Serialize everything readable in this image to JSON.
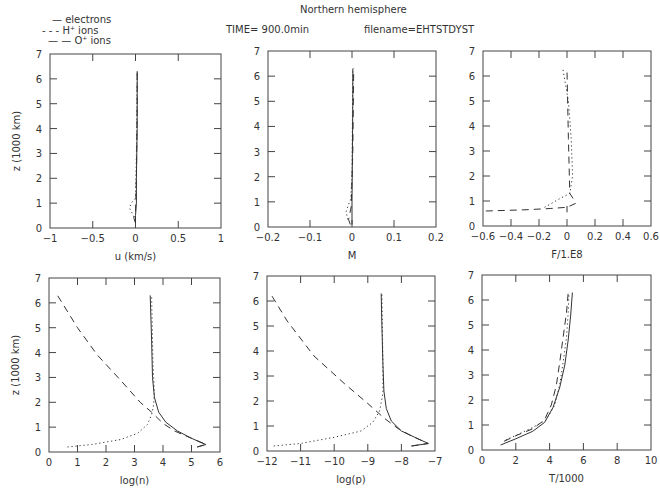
{
  "header": {
    "title": "Northern hemisphere",
    "time_label": "TIME= 900.0min",
    "filename_label": "filename=EHTSTDYST"
  },
  "legend": {
    "items": [
      {
        "style": "solid",
        "marker": "—",
        "label": "electrons"
      },
      {
        "style": "dotted",
        "marker": "- - -",
        "label": "H",
        "sup": "+",
        "suffix": " ions"
      },
      {
        "style": "dashed",
        "marker": "— —",
        "label": "O",
        "sup": "+",
        "suffix": " ions"
      }
    ]
  },
  "colors": {
    "line": "#333333",
    "axes": "#444444",
    "background": "#ffffff"
  },
  "chart_data": [
    {
      "type": "line",
      "id": "velocity",
      "box": [
        50,
        54,
        221,
        228
      ],
      "xlabel": "u (km/s)",
      "ylabel": "z (1000 km)",
      "xlim": [
        -1,
        1
      ],
      "ylim": [
        0,
        7
      ],
      "xticks": [
        -1,
        -0.5,
        0,
        0.5,
        1
      ],
      "xticklabels": [
        "−1",
        "−0.5",
        "0",
        "0.5",
        "1"
      ],
      "yticks": [
        0,
        1,
        2,
        3,
        4,
        5,
        6,
        7
      ],
      "series": [
        {
          "name": "electrons",
          "style": "solid",
          "x": [
            0.0,
            0.0,
            0.01,
            0.01,
            0.02,
            0.02,
            0.02
          ],
          "y": [
            0.2,
            0.5,
            1.0,
            2.0,
            4.0,
            5.5,
            6.3
          ]
        },
        {
          "name": "H+ ions",
          "style": "dotted",
          "x": [
            0.0,
            -0.04,
            -0.07,
            -0.05,
            0.0,
            0.01,
            0.02
          ],
          "y": [
            0.3,
            0.6,
            0.8,
            1.0,
            1.2,
            3.0,
            6.3
          ]
        },
        {
          "name": "O+ ions",
          "style": "dashed",
          "x": [
            0.0,
            -0.02,
            0.0,
            0.01,
            0.02,
            0.02
          ],
          "y": [
            0.2,
            0.4,
            0.6,
            2.0,
            5.0,
            6.3
          ]
        }
      ]
    },
    {
      "type": "line",
      "id": "mach",
      "box": [
        268,
        51,
        436,
        227
      ],
      "xlabel": "M",
      "ylabel": "",
      "xlim": [
        -0.2,
        0.2
      ],
      "ylim": [
        0,
        7
      ],
      "xticks": [
        -0.2,
        -0.1,
        0,
        0.1,
        0.2
      ],
      "xticklabels": [
        "−0.2",
        "−0.1",
        "0",
        "0.1",
        "0.2"
      ],
      "yticks": [
        0,
        1,
        2,
        3,
        4,
        5,
        6,
        7
      ],
      "series": [
        {
          "name": "electrons",
          "style": "solid",
          "x": [
            0.0,
            0.0,
            0.001,
            0.002,
            0.002
          ],
          "y": [
            0.1,
            1.0,
            3.0,
            5.0,
            6.3
          ]
        },
        {
          "name": "H+ ions",
          "style": "dotted",
          "x": [
            -0.01,
            -0.014,
            -0.008,
            -0.003,
            0.0,
            0.002
          ],
          "y": [
            0.3,
            0.6,
            0.9,
            1.1,
            2.0,
            6.3
          ]
        },
        {
          "name": "O+ ions",
          "style": "dashed",
          "x": [
            -0.004,
            -0.008,
            -0.002,
            0.002,
            0.004
          ],
          "y": [
            0.1,
            0.3,
            0.8,
            3.0,
            6.3
          ]
        }
      ]
    },
    {
      "type": "line",
      "id": "flux",
      "box": [
        483,
        51,
        651,
        226
      ],
      "xlabel": "F/1.E8",
      "ylabel": "",
      "xlim": [
        -0.6,
        0.6
      ],
      "ylim": [
        0,
        7
      ],
      "xticks": [
        -0.6,
        -0.4,
        -0.2,
        0,
        0.2,
        0.4,
        0.6
      ],
      "xticklabels": [
        "−0.6",
        "−0.4",
        "−0.2",
        "0",
        "0.2",
        "0.4",
        "0.6"
      ],
      "yticks": [
        0,
        1,
        2,
        3,
        4,
        5,
        6,
        7
      ],
      "series": [
        {
          "name": "electrons",
          "style": "solid",
          "x": [
            0.0,
            0.0
          ],
          "y": [
            0.55,
            0.8
          ]
        },
        {
          "name": "H+ ions",
          "style": "dotted",
          "x": [
            -0.16,
            -0.05,
            0.02,
            0.04,
            0.03,
            0.01,
            -0.03
          ],
          "y": [
            0.75,
            1.1,
            1.3,
            2.0,
            3.5,
            5.0,
            6.3
          ]
        },
        {
          "name": "O+ ions",
          "style": "dashed",
          "x": [
            -0.58,
            -0.3,
            -0.12,
            0.0,
            0.06,
            0.05,
            0.02,
            0.01,
            0.0
          ],
          "y": [
            0.6,
            0.65,
            0.7,
            0.75,
            0.9,
            1.05,
            1.3,
            3.5,
            6.2
          ]
        }
      ]
    },
    {
      "type": "line",
      "id": "density",
      "box": [
        49,
        278,
        220,
        452
      ],
      "xlabel": "log(n)",
      "ylabel": "z (1000 km)",
      "xlim": [
        0,
        6
      ],
      "ylim": [
        0,
        7
      ],
      "xticks": [
        0,
        1,
        2,
        3,
        4,
        5,
        6
      ],
      "xticklabels": [
        "0",
        "1",
        "2",
        "3",
        "4",
        "5",
        "6"
      ],
      "yticks": [
        0,
        1,
        2,
        3,
        4,
        5,
        6,
        7
      ],
      "series": [
        {
          "name": "electrons",
          "style": "solid",
          "x": [
            5.2,
            5.5,
            5.0,
            4.5,
            4.1,
            3.85,
            3.7,
            3.63,
            3.6,
            3.55
          ],
          "y": [
            0.2,
            0.3,
            0.55,
            0.85,
            1.2,
            1.6,
            2.2,
            3.0,
            4.5,
            6.3
          ]
        },
        {
          "name": "H+ ions",
          "style": "dotted",
          "x": [
            0.65,
            1.5,
            2.5,
            3.1,
            3.45,
            3.6,
            3.67,
            3.7,
            3.65,
            3.6
          ],
          "y": [
            0.2,
            0.3,
            0.5,
            0.75,
            1.1,
            1.5,
            1.9,
            2.4,
            3.5,
            6.3
          ]
        },
        {
          "name": "O+ ions",
          "style": "dashed",
          "x": [
            5.2,
            5.5,
            5.0,
            4.4,
            4.0,
            3.6,
            3.2,
            2.5,
            1.7,
            1.0,
            0.3
          ],
          "y": [
            0.2,
            0.3,
            0.55,
            0.85,
            1.15,
            1.6,
            2.0,
            2.9,
            3.9,
            5.0,
            6.3
          ]
        }
      ]
    },
    {
      "type": "line",
      "id": "pressure",
      "box": [
        267,
        276,
        435,
        451
      ],
      "xlabel": "log(p)",
      "ylabel": "",
      "xlim": [
        -12,
        -7
      ],
      "ylim": [
        0,
        7
      ],
      "xticks": [
        -12,
        -11,
        -10,
        -9,
        -8,
        -7
      ],
      "xticklabels": [
        "−12",
        "−11",
        "−10",
        "−9",
        "−8",
        "−7"
      ],
      "yticks": [
        0,
        1,
        2,
        3,
        4,
        5,
        6,
        7
      ],
      "series": [
        {
          "name": "electrons",
          "style": "solid",
          "x": [
            -7.7,
            -7.2,
            -7.6,
            -8.0,
            -8.3,
            -8.45,
            -8.52,
            -8.55,
            -8.58,
            -8.6
          ],
          "y": [
            0.2,
            0.3,
            0.55,
            0.8,
            1.2,
            1.7,
            2.4,
            3.5,
            5.0,
            6.3
          ]
        },
        {
          "name": "H+ ions",
          "style": "dotted",
          "x": [
            -11.8,
            -11.0,
            -10.0,
            -9.2,
            -8.85,
            -8.65,
            -8.55,
            -8.55,
            -8.58
          ],
          "y": [
            0.2,
            0.3,
            0.55,
            0.8,
            1.15,
            1.6,
            2.3,
            3.5,
            6.3
          ]
        },
        {
          "name": "O+ ions",
          "style": "dashed",
          "x": [
            -7.7,
            -7.2,
            -7.7,
            -8.1,
            -8.5,
            -9.0,
            -9.7,
            -10.6,
            -11.4,
            -11.9
          ],
          "y": [
            0.2,
            0.3,
            0.6,
            0.9,
            1.3,
            1.9,
            2.7,
            3.8,
            5.2,
            6.3
          ]
        }
      ]
    },
    {
      "type": "line",
      "id": "temperature",
      "box": [
        482,
        275,
        651,
        450
      ],
      "xlabel": "T/1000",
      "ylabel": "",
      "xlim": [
        0,
        10
      ],
      "ylim": [
        0,
        7
      ],
      "xticks": [
        0,
        2,
        4,
        6,
        8,
        10
      ],
      "xticklabels": [
        "0",
        "2",
        "4",
        "6",
        "8",
        "10"
      ],
      "yticks": [
        0,
        1,
        2,
        3,
        4,
        5,
        6,
        7
      ],
      "series": [
        {
          "name": "electrons",
          "style": "solid",
          "x": [
            1.1,
            2.0,
            3.0,
            3.7,
            4.2,
            4.6,
            4.9,
            5.1,
            5.25,
            5.35
          ],
          "y": [
            0.2,
            0.45,
            0.75,
            1.1,
            1.7,
            2.5,
            3.4,
            4.4,
            5.4,
            6.3
          ]
        },
        {
          "name": "H+ ions",
          "style": "dotted",
          "x": [
            1.4,
            2.2,
            3.0,
            3.8,
            4.3,
            4.6,
            4.8,
            5.0,
            5.1,
            5.15
          ],
          "y": [
            0.4,
            0.65,
            0.9,
            1.2,
            1.8,
            2.6,
            3.5,
            4.5,
            5.5,
            6.3
          ]
        },
        {
          "name": "O+ ions",
          "style": "dashed",
          "x": [
            1.3,
            2.1,
            3.0,
            3.7,
            4.1,
            4.4,
            4.6,
            4.8,
            5.0,
            5.1
          ],
          "y": [
            0.35,
            0.6,
            0.85,
            1.2,
            1.8,
            2.6,
            3.5,
            4.5,
            5.5,
            6.3
          ]
        }
      ]
    }
  ]
}
